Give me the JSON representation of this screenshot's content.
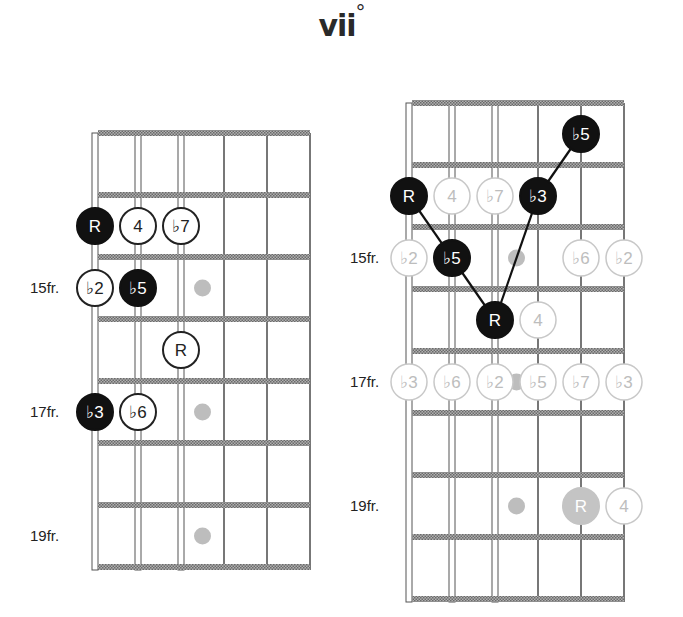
{
  "title": {
    "text": "vii",
    "superscript": "°"
  },
  "diagrams": [
    {
      "id": "left",
      "fret_labels": [
        {
          "text": "15fr.",
          "row": 2
        },
        {
          "text": "17fr.",
          "row": 4
        },
        {
          "text": "19fr.",
          "row": 6
        }
      ],
      "notes": [
        {
          "label": "R",
          "string": 0,
          "row": 1,
          "style": "filled"
        },
        {
          "label": "4",
          "string": 1,
          "row": 1,
          "style": "open"
        },
        {
          "label": "♭7",
          "string": 2,
          "row": 1,
          "style": "open"
        },
        {
          "label": "♭2",
          "string": 0,
          "row": 2,
          "style": "open"
        },
        {
          "label": "♭5",
          "string": 1,
          "row": 2,
          "style": "filled"
        },
        {
          "label": "R",
          "string": 2,
          "row": 3,
          "style": "open"
        },
        {
          "label": "♭3",
          "string": 0,
          "row": 4,
          "style": "filled"
        },
        {
          "label": "♭6",
          "string": 1,
          "row": 4,
          "style": "open"
        }
      ],
      "inlays": [
        {
          "between": 2,
          "row": 2
        },
        {
          "between": 2,
          "row": 4
        },
        {
          "between": 2,
          "row": 6
        }
      ]
    },
    {
      "id": "right",
      "fret_labels": [
        {
          "text": "15fr.",
          "row": 2
        },
        {
          "text": "17fr.",
          "row": 4
        },
        {
          "text": "19fr.",
          "row": 6
        }
      ],
      "notes": [
        {
          "label": "♭5",
          "string": 4,
          "row": 0,
          "style": "filled"
        },
        {
          "label": "R",
          "string": 0,
          "row": 1,
          "style": "filled"
        },
        {
          "label": "4",
          "string": 1,
          "row": 1,
          "style": "faded"
        },
        {
          "label": "♭7",
          "string": 2,
          "row": 1,
          "style": "faded"
        },
        {
          "label": "♭3",
          "string": 3,
          "row": 1,
          "style": "filled"
        },
        {
          "label": "♭2",
          "string": 0,
          "row": 2,
          "style": "faded"
        },
        {
          "label": "♭5",
          "string": 1,
          "row": 2,
          "style": "filled"
        },
        {
          "label": "♭6",
          "string": 4,
          "row": 2,
          "style": "faded"
        },
        {
          "label": "♭2",
          "string": 5,
          "row": 2,
          "style": "faded"
        },
        {
          "label": "R",
          "string": 2,
          "row": 3,
          "style": "filled"
        },
        {
          "label": "4",
          "string": 3,
          "row": 3,
          "style": "faded"
        },
        {
          "label": "♭3",
          "string": 0,
          "row": 4,
          "style": "faded"
        },
        {
          "label": "♭6",
          "string": 1,
          "row": 4,
          "style": "faded"
        },
        {
          "label": "♭2",
          "string": 2,
          "row": 4,
          "style": "faded"
        },
        {
          "label": "♭5",
          "string": 3,
          "row": 4,
          "style": "faded"
        },
        {
          "label": "♭7",
          "string": 4,
          "row": 4,
          "style": "faded"
        },
        {
          "label": "♭3",
          "string": 5,
          "row": 4,
          "style": "faded"
        },
        {
          "label": "R",
          "string": 4,
          "row": 6,
          "style": "faded-filled"
        },
        {
          "label": "4",
          "string": 5,
          "row": 6,
          "style": "faded"
        }
      ],
      "connections": [
        {
          "from": [
            0,
            1
          ],
          "to": [
            1,
            2
          ]
        },
        {
          "from": [
            1,
            2
          ],
          "to": [
            2,
            3
          ]
        },
        {
          "from": [
            2,
            3
          ],
          "to": [
            3,
            1
          ]
        },
        {
          "from": [
            3,
            1
          ],
          "to": [
            4,
            0
          ]
        }
      ],
      "inlays": [
        {
          "between": 2,
          "row": 2
        },
        {
          "between": 2,
          "row": 4
        },
        {
          "between": 2,
          "row": 6
        }
      ]
    }
  ],
  "colors": {
    "filled": "#111111",
    "open_stroke": "#222222",
    "faded_stroke": "#c8c8c8",
    "faded_text": "#bdbdbd",
    "inlay": "#bdbdbd",
    "fret": "#8a8a8a",
    "string": "#555555"
  }
}
